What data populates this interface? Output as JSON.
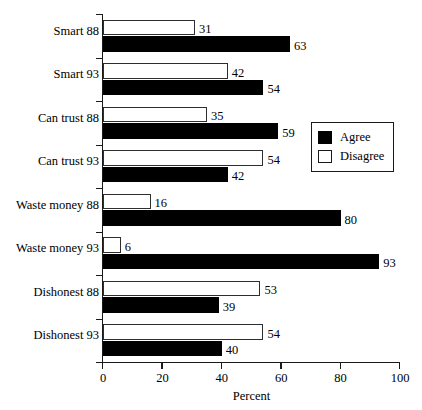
{
  "chart_data": {
    "type": "bar",
    "orientation": "horizontal",
    "title": "",
    "xlabel": "Percent",
    "ylabel": "",
    "xlim": [
      0,
      100
    ],
    "xticks": [
      0,
      20,
      40,
      60,
      80,
      100
    ],
    "xtick_labels": [
      "0",
      "20",
      "40",
      "60",
      "80",
      "100"
    ],
    "grid": false,
    "legend_position": "center-right",
    "categories": [
      "Smart 88",
      "Smart 93",
      "Can trust 88",
      "Can trust 93",
      "Waste money 88",
      "Waste money 93",
      "Dishonest 88",
      "Dishonest 93"
    ],
    "series": [
      {
        "name": "Disagree",
        "color": "#ffffff",
        "edge_color": "#2e2e2e",
        "values": [
          31,
          42,
          35,
          54,
          16,
          6,
          53,
          54
        ]
      },
      {
        "name": "Agree",
        "color": "#000000",
        "edge_color": "#000000",
        "values": [
          63,
          54,
          59,
          42,
          80,
          93,
          39,
          40
        ]
      }
    ]
  },
  "legend": {
    "entries": [
      {
        "label": "Agree",
        "swatch": "filled-black"
      },
      {
        "label": "Disagree",
        "swatch": "outlined-white"
      }
    ]
  },
  "axis": {
    "x_title": "Percent"
  }
}
